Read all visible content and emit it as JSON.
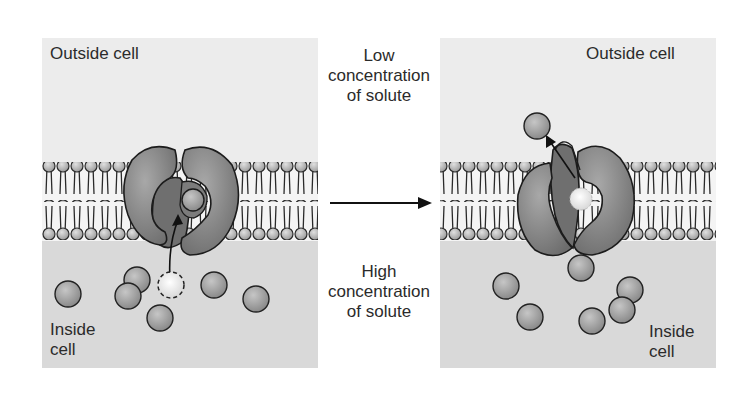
{
  "diagram": {
    "left_panel": {
      "outside_label": "Outside cell",
      "inside_label_line1": "Inside",
      "inside_label_line2": "cell",
      "state": "carrier open toward inside, solute binding"
    },
    "right_panel": {
      "outside_label": "Outside cell",
      "inside_label_line1": "Inside",
      "inside_label_line2": "cell",
      "state": "carrier open toward outside, solute released"
    },
    "center": {
      "top_line1": "Low",
      "top_line2": "concentration",
      "top_line3": "of solute",
      "bottom_line1": "High",
      "bottom_line2": "concentration",
      "bottom_line3": "of solute",
      "arrow": "right-arrow"
    },
    "colors": {
      "outside_bg": "#ececec",
      "inside_bg": "#d8d8d8",
      "membrane_band": "#f3f3f3",
      "protein": "#8e8e8e",
      "protein_inner": "#6f6f6f",
      "solute": "#9a9a9a",
      "solute_highlight": "#f4f4f4",
      "outline": "#1c1c1c"
    }
  }
}
